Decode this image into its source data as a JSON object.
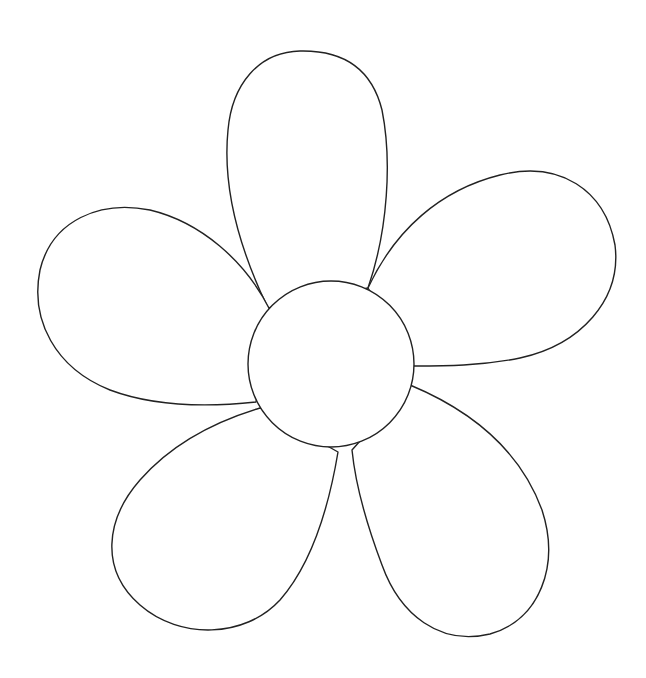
{
  "image": {
    "subject": "flower outline",
    "petal_count": 5,
    "colors": {
      "background": "#ffffff",
      "stroke": "#222222",
      "fill": "#ffffff"
    },
    "center": {
      "cx": 331,
      "cy": 364,
      "r": 83
    }
  }
}
